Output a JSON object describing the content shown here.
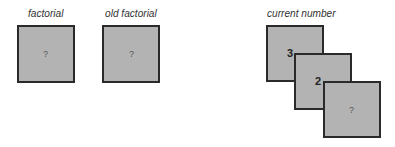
{
  "variables": [
    {
      "name": "factorial",
      "value": "?"
    },
    {
      "name": "old factorial",
      "value": "?"
    }
  ],
  "current_number": {
    "label": "current number",
    "stack": [
      "3",
      "2",
      "?"
    ]
  }
}
